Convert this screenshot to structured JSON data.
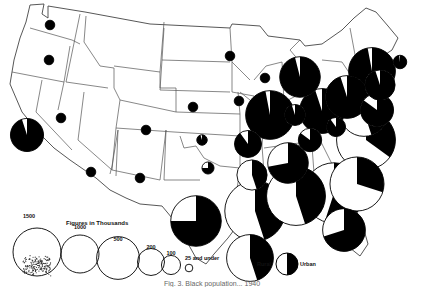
{
  "figure": {
    "caption": "Fig. 3. Black population, urban and rural, 1940",
    "caption_visible": "Fig. 3. Black population... 1940",
    "colors": {
      "urban": "#000000",
      "rural": "#ffffff",
      "outline": "#000000",
      "border": "#555555"
    }
  },
  "legend": {
    "title": "Figures in Thousands",
    "sizes": [
      {
        "label": "1500",
        "value": 1500
      },
      {
        "label": "1000",
        "value": 1000
      },
      {
        "label": "500",
        "value": 500
      },
      {
        "label": "200",
        "value": 200
      },
      {
        "label": "100",
        "value": 100
      },
      {
        "label": "25 and under",
        "value": 25
      }
    ],
    "key": {
      "rural_label": "Rural",
      "urban_label": "Urban"
    }
  },
  "chart_data": {
    "type": "proportional-pie-map",
    "title": "Figures in Thousands",
    "units": "thousands",
    "note": "Each state symbol: circle area proportional to population; black = urban share, white = rural share. Values estimated from symbol sizes.",
    "states": [
      {
        "name": "Washington",
        "total": 25,
        "urban_share": 1.0
      },
      {
        "name": "Oregon",
        "total": 25,
        "urban_share": 1.0
      },
      {
        "name": "California",
        "total": 300,
        "urban_share": 0.95
      },
      {
        "name": "Nevada",
        "total": 25,
        "urban_share": 1.0
      },
      {
        "name": "Colorado",
        "total": 25,
        "urban_share": 1.0
      },
      {
        "name": "Arizona",
        "total": 25,
        "urban_share": 1.0
      },
      {
        "name": "New Mexico",
        "total": 25,
        "urban_share": 1.0
      },
      {
        "name": "Nebraska",
        "total": 25,
        "urban_share": 1.0
      },
      {
        "name": "Kansas",
        "total": 30,
        "urban_share": 0.95
      },
      {
        "name": "Oklahoma",
        "total": 40,
        "urban_share": 0.75
      },
      {
        "name": "Texas",
        "total": 700,
        "urban_share": 0.75
      },
      {
        "name": "Minnesota",
        "total": 25,
        "urban_share": 1.0
      },
      {
        "name": "Iowa",
        "total": 25,
        "urban_share": 1.0
      },
      {
        "name": "Wisconsin",
        "total": 25,
        "urban_share": 1.0
      },
      {
        "name": "Missouri",
        "total": 200,
        "urban_share": 0.9
      },
      {
        "name": "Arkansas",
        "total": 250,
        "urban_share": 0.45
      },
      {
        "name": "Louisiana",
        "total": 600,
        "urban_share": 0.45
      },
      {
        "name": "Illinois",
        "total": 650,
        "urban_share": 0.97
      },
      {
        "name": "Michigan",
        "total": 450,
        "urban_share": 0.96
      },
      {
        "name": "Indiana",
        "total": 120,
        "urban_share": 0.95
      },
      {
        "name": "Ohio",
        "total": 550,
        "urban_share": 0.95
      },
      {
        "name": "Kentucky",
        "total": 150,
        "urban_share": 0.85
      },
      {
        "name": "Tennessee",
        "total": 450,
        "urban_share": 0.72
      },
      {
        "name": "Mississippi",
        "total": 1000,
        "urban_share": 0.45
      },
      {
        "name": "Alabama",
        "total": 950,
        "urban_share": 0.45
      },
      {
        "name": "Georgia",
        "total": 1000,
        "urban_share": 0.55
      },
      {
        "name": "Florida",
        "total": 500,
        "urban_share": 0.7
      },
      {
        "name": "South Carolina",
        "total": 800,
        "urban_share": 0.3
      },
      {
        "name": "North Carolina",
        "total": 950,
        "urban_share": 0.35
      },
      {
        "name": "Virginia",
        "total": 650,
        "urban_share": 0.45
      },
      {
        "name": "West Virginia",
        "total": 100,
        "urban_share": 0.9
      },
      {
        "name": "Pennsylvania",
        "total": 500,
        "urban_share": 0.95
      },
      {
        "name": "Maryland",
        "total": 300,
        "urban_share": 0.85
      },
      {
        "name": "New Jersey",
        "total": 250,
        "urban_share": 0.95
      },
      {
        "name": "New York",
        "total": 600,
        "urban_share": 0.97
      },
      {
        "name": "Massachusetts",
        "total": 50,
        "urban_share": 0.98
      }
    ]
  }
}
